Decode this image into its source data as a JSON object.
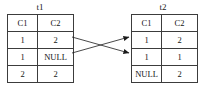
{
  "diagram": {
    "type": "table-mapping-diagram",
    "background_color": "#ffffff",
    "line_color": "#1a1a1a",
    "border_color": "#3c3c3c",
    "tables": [
      {
        "name": "t1",
        "title": "t1",
        "columns": [
          "C1",
          "C2"
        ],
        "rows": [
          [
            "1",
            "2"
          ],
          [
            "1",
            "NULL"
          ],
          [
            "2",
            "2"
          ]
        ]
      },
      {
        "name": "t2",
        "title": "t2",
        "columns": [
          "C1",
          "C2"
        ],
        "rows": [
          [
            "1",
            "2"
          ],
          [
            "1",
            "1"
          ],
          [
            "NULL",
            "2"
          ]
        ]
      }
    ],
    "connectors": [
      {
        "name": "t1-row1-to-t2-row2",
        "from_table": "t1",
        "from_row": 1,
        "to_table": "t2",
        "to_row": 2,
        "arrowhead": "right"
      },
      {
        "name": "t1-row2-to-t2-row1",
        "from_table": "t1",
        "from_row": 2,
        "to_table": "t2",
        "to_row": 1,
        "arrowhead": "right"
      }
    ]
  }
}
